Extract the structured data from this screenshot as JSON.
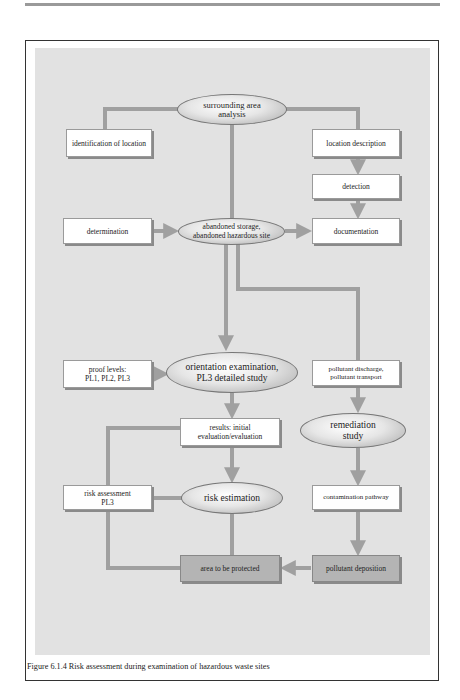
{
  "figure": {
    "caption": "Figure 6.1.4 Risk assessment during examination of hazardous waste sites",
    "colors": {
      "panel_background": "#e2e2e2",
      "connector": "#a0a0a0",
      "box_fill": "#ffffff",
      "highlight_box_fill": "#b4b4b4",
      "frame_border": "#333333"
    }
  },
  "nodes": {
    "surrounding_area": {
      "label": "surrounding area\nanalysis",
      "shape": "ellipse"
    },
    "identification": {
      "label": "identification of location",
      "shape": "box"
    },
    "location_description": {
      "label": "location description",
      "shape": "box"
    },
    "detection": {
      "label": "detection",
      "shape": "box"
    },
    "determination": {
      "label": "determination",
      "shape": "box"
    },
    "abandoned_site": {
      "label": "abandoned storage,\nabandoned hazardous site",
      "shape": "ellipse"
    },
    "documentation": {
      "label": "documentation",
      "shape": "box"
    },
    "proof_levels": {
      "label": "proof levels:\nPL1, PL2, PL3",
      "shape": "box"
    },
    "orientation_exam": {
      "label": "orientation examination,\nPL3 detailed study",
      "shape": "ellipse"
    },
    "pollutant_discharge": {
      "label": "pollutant discharge,\npollutant transport",
      "shape": "box"
    },
    "results": {
      "label": "results: initial\nevaluation/evaluation",
      "shape": "box"
    },
    "remediation_study": {
      "label": "remediation\nstudy",
      "shape": "ellipse"
    },
    "risk_assessment": {
      "label": "risk assessment\nPL3",
      "shape": "box"
    },
    "risk_estimation": {
      "label": "risk estimation",
      "shape": "ellipse"
    },
    "contamination_pathway": {
      "label": "contamination pathway",
      "shape": "box"
    },
    "area_protected": {
      "label": "area to be protected",
      "shape": "box"
    },
    "pollutant_deposition": {
      "label": "pollutant deposition",
      "shape": "box"
    }
  },
  "edges": [
    {
      "from": "surrounding_area",
      "to": "identification"
    },
    {
      "from": "surrounding_area",
      "to": "location_description"
    },
    {
      "from": "surrounding_area",
      "to": "abandoned_site"
    },
    {
      "from": "location_description",
      "to": "detection",
      "arrow": true
    },
    {
      "from": "detection",
      "to": "documentation",
      "arrow": true
    },
    {
      "from": "determination",
      "to": "abandoned_site",
      "arrow": true
    },
    {
      "from": "abandoned_site",
      "to": "documentation",
      "arrow": true
    },
    {
      "from": "abandoned_site",
      "to": "orientation_exam",
      "arrow": true
    },
    {
      "from": "abandoned_site",
      "to": "pollutant_discharge"
    },
    {
      "from": "proof_levels",
      "to": "orientation_exam",
      "arrow": true
    },
    {
      "from": "orientation_exam",
      "to": "results",
      "arrow": true
    },
    {
      "from": "pollutant_discharge",
      "to": "remediation_study",
      "arrow": true
    },
    {
      "from": "results",
      "to": "risk_estimation",
      "arrow": true
    },
    {
      "from": "results",
      "to": "area_protected"
    },
    {
      "from": "risk_assessment",
      "to": "risk_estimation"
    },
    {
      "from": "risk_estimation",
      "to": "area_protected"
    },
    {
      "from": "remediation_study",
      "to": "contamination_pathway",
      "arrow": true
    },
    {
      "from": "contamination_pathway",
      "to": "pollutant_deposition",
      "arrow": true
    },
    {
      "from": "pollutant_deposition",
      "to": "area_protected",
      "arrow": true
    }
  ]
}
